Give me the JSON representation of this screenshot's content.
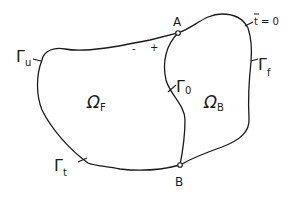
{
  "diagram": {
    "stroke_color": "#1a1a1a",
    "background": "#ffffff",
    "regions": [
      {
        "id": "omega_f",
        "symbol": "Ω",
        "subscript": "F"
      },
      {
        "id": "omega_b",
        "symbol": "Ω",
        "subscript": "B"
      }
    ],
    "boundaries": [
      {
        "id": "gamma_u",
        "symbol": "Γ",
        "subscript": "u"
      },
      {
        "id": "gamma_t",
        "symbol": "Γ",
        "subscript": "t"
      },
      {
        "id": "gamma_f",
        "symbol": "Γ",
        "subscript": "f"
      },
      {
        "id": "gamma_0",
        "symbol": "Γ",
        "subscript": "0"
      }
    ],
    "points": [
      {
        "id": "A",
        "label": "A"
      },
      {
        "id": "B",
        "label": "B"
      }
    ],
    "sign_labels": {
      "minus": "-",
      "plus": "+"
    },
    "condition": {
      "var": "t",
      "bar": "¯",
      "text": "= 0"
    }
  }
}
